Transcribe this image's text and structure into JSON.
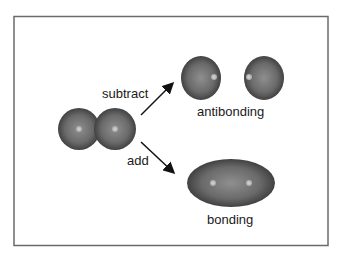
{
  "diagram": {
    "labels": {
      "subtract": "subtract",
      "add": "add",
      "antibonding": "antibonding",
      "bonding": "bonding"
    },
    "colors": {
      "frame": "#6b6b6b",
      "orbital_dark": "#3a3a3a",
      "orbital_light": "#8a8a8a",
      "nucleus": "#c8c8c8",
      "arrow": "#111111"
    }
  }
}
